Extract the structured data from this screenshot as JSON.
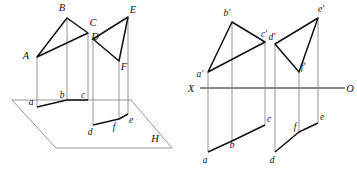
{
  "figure": {
    "stroke_dark": "#111111",
    "stroke_light": "#8a8a8a",
    "background": "#ffffff",
    "width": 357,
    "height": 169
  },
  "pictorial": {
    "caption_plane": "H",
    "triangle_abc": {
      "vertices": [
        "A",
        "B",
        "C"
      ],
      "A": {
        "x": 37,
        "y": 57
      },
      "B": {
        "x": 67,
        "y": 18
      },
      "C": {
        "x": 88,
        "y": 33
      }
    },
    "triangle_def": {
      "vertices": [
        "D",
        "E",
        "F"
      ],
      "D": {
        "x": 93,
        "y": 39
      },
      "E": {
        "x": 128,
        "y": 17
      },
      "F": {
        "x": 119,
        "y": 61
      }
    },
    "projections_abc": {
      "vertices": [
        "a",
        "b",
        "c"
      ],
      "a": {
        "x": 37,
        "y": 107
      },
      "b": {
        "x": 67,
        "y": 100
      },
      "c": {
        "x": 88,
        "y": 100
      }
    },
    "projections_def": {
      "vertices": [
        "d",
        "e",
        "f"
      ],
      "d": {
        "x": 93,
        "y": 125
      },
      "e": {
        "x": 128,
        "y": 114
      },
      "f": {
        "x": 119,
        "y": 119
      }
    },
    "plane_h": {
      "label": "H",
      "label_pos": {
        "x": 155,
        "y": 141
      },
      "corners": [
        {
          "x": 12,
          "y": 100
        },
        {
          "x": 131,
          "y": 100
        },
        {
          "x": 172,
          "y": 148
        },
        {
          "x": 56,
          "y": 148
        }
      ]
    },
    "labels": [
      {
        "text": "A",
        "x": 26,
        "y": 59,
        "case": "upper"
      },
      {
        "text": "B",
        "x": 62,
        "y": 11,
        "case": "upper"
      },
      {
        "text": "C",
        "x": 91,
        "y": 26,
        "case": "upper"
      },
      {
        "text": "D",
        "x": 93,
        "y": 40,
        "case": "upper"
      },
      {
        "text": "E",
        "x": 130,
        "y": 13,
        "case": "upper"
      },
      {
        "text": "F",
        "x": 121,
        "y": 69,
        "case": "upper"
      },
      {
        "text": "a",
        "x": 31,
        "y": 105,
        "case": "lower"
      },
      {
        "text": "b",
        "x": 63,
        "y": 98,
        "case": "lower"
      },
      {
        "text": "c",
        "x": 84,
        "y": 98,
        "case": "lower"
      },
      {
        "text": "d",
        "x": 90,
        "y": 134,
        "case": "lower"
      },
      {
        "text": "f",
        "x": 113,
        "y": 129,
        "case": "lower"
      },
      {
        "text": "e",
        "x": 129,
        "y": 122,
        "case": "lower"
      },
      {
        "text": "H",
        "x": 155,
        "y": 141,
        "case": "upper"
      }
    ]
  },
  "orthographic": {
    "axis": {
      "left_label": "X",
      "right_label": "O",
      "y": 88,
      "x_start": 200,
      "x_end": 345,
      "left_label_pos": {
        "x": 189,
        "y": 92
      },
      "right_label_pos": {
        "x": 348,
        "y": 92
      }
    },
    "frontal_abc": {
      "vertices": [
        "a'",
        "b'",
        "c'"
      ],
      "a_prime": {
        "x": 208,
        "y": 72
      },
      "b_prime": {
        "x": 232,
        "y": 22
      },
      "c_prime": {
        "x": 265,
        "y": 42
      }
    },
    "frontal_def": {
      "vertices": [
        "d'",
        "e'",
        "f'"
      ],
      "d_prime": {
        "x": 275,
        "y": 44
      },
      "e_prime": {
        "x": 318,
        "y": 18
      },
      "f_prime": {
        "x": 299,
        "y": 72
      }
    },
    "horizontal_abc": {
      "vertices": [
        "a",
        "b",
        "c"
      ],
      "a": {
        "x": 208,
        "y": 152
      },
      "b": {
        "x": 232,
        "y": 141
      },
      "c": {
        "x": 265,
        "y": 125
      }
    },
    "horizontal_def": {
      "vertices": [
        "d",
        "e",
        "f"
      ],
      "d": {
        "x": 275,
        "y": 152
      },
      "e": {
        "x": 318,
        "y": 123
      },
      "f": {
        "x": 299,
        "y": 132
      }
    },
    "labels": [
      {
        "text": "b'",
        "x": 227,
        "y": 16,
        "case": "lower"
      },
      {
        "text": "c'",
        "x": 262,
        "y": 37,
        "case": "lower"
      },
      {
        "text": "a'",
        "x": 198,
        "y": 76,
        "case": "lower"
      },
      {
        "text": "e'",
        "x": 319,
        "y": 13,
        "case": "lower"
      },
      {
        "text": "d'",
        "x": 272,
        "y": 40,
        "case": "lower"
      },
      {
        "text": "f'",
        "x": 301,
        "y": 70,
        "case": "lower"
      },
      {
        "text": "X",
        "x": 189,
        "y": 92,
        "case": "upper"
      },
      {
        "text": "O",
        "x": 348,
        "y": 92,
        "case": "upper"
      },
      {
        "text": "c",
        "x": 267,
        "y": 123,
        "case": "lower"
      },
      {
        "text": "b",
        "x": 231,
        "y": 146,
        "case": "lower"
      },
      {
        "text": "a",
        "x": 205,
        "y": 162,
        "case": "lower"
      },
      {
        "text": "e",
        "x": 320,
        "y": 121,
        "case": "lower"
      },
      {
        "text": "f",
        "x": 294,
        "y": 130,
        "case": "lower"
      },
      {
        "text": "d",
        "x": 272,
        "y": 162,
        "case": "lower"
      }
    ]
  }
}
